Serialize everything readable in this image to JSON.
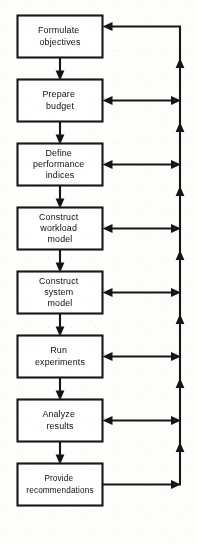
{
  "diagram": {
    "kind": "flowchart",
    "background_color": "#fdfdfb",
    "stroke_color": "#16161a",
    "box_fill_color": "#ffffff",
    "nodes": [
      {
        "id": "n1",
        "lines": [
          "Formulate",
          "objectives"
        ]
      },
      {
        "id": "n2",
        "lines": [
          "Prepare",
          "budget"
        ]
      },
      {
        "id": "n3",
        "lines": [
          "Define",
          "performance",
          "indices"
        ]
      },
      {
        "id": "n4",
        "lines": [
          "Construct",
          "workload",
          "model"
        ]
      },
      {
        "id": "n5",
        "lines": [
          "Construct",
          "system",
          "model"
        ]
      },
      {
        "id": "n6",
        "lines": [
          "Run",
          "experiments"
        ]
      },
      {
        "id": "n7",
        "lines": [
          "Analyze",
          "results"
        ]
      },
      {
        "id": "n8",
        "lines": [
          "Provide",
          "recommendations"
        ]
      }
    ],
    "flow_edges": [
      {
        "from": "n1",
        "to": "n2",
        "direction": "down"
      },
      {
        "from": "n2",
        "to": "n3",
        "direction": "down"
      },
      {
        "from": "n3",
        "to": "n4",
        "direction": "down"
      },
      {
        "from": "n4",
        "to": "n5",
        "direction": "down"
      },
      {
        "from": "n5",
        "to": "n6",
        "direction": "down"
      },
      {
        "from": "n6",
        "to": "n7",
        "direction": "down"
      },
      {
        "from": "n7",
        "to": "n8",
        "direction": "down"
      }
    ],
    "feedback_bus": {
      "description": "Vertical feedback line on the right carrying flow upward from the final box back to earlier stages",
      "direction": "up",
      "source": "n8",
      "top_target": "n1",
      "bidirectional_nodes": [
        "n2",
        "n3",
        "n4",
        "n5",
        "n6",
        "n7"
      ]
    }
  }
}
